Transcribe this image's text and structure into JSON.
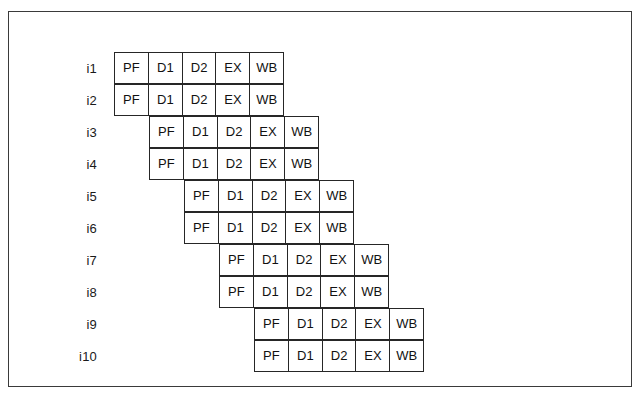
{
  "figure": {
    "type": "pipeline-timing-diagram",
    "stage_names": [
      "PF",
      "D1",
      "D2",
      "EX",
      "WB"
    ],
    "cell_width_px": 35,
    "cell_height_px": 32,
    "grid_origin_x_px": 113,
    "grid_origin_y_px": 52,
    "label_right_edge_px": 96,
    "colors": {
      "frame_border": "#3a3a3a",
      "cell_border": "#262626",
      "text": "#111111",
      "background": "#ffffff"
    },
    "rows": [
      {
        "label": "i1",
        "offset": 0,
        "stages": [
          "PF",
          "D1",
          "D2",
          "EX",
          "WB"
        ]
      },
      {
        "label": "i2",
        "offset": 0,
        "stages": [
          "PF",
          "D1",
          "D2",
          "EX",
          "WB"
        ]
      },
      {
        "label": "i3",
        "offset": 1,
        "stages": [
          "PF",
          "D1",
          "D2",
          "EX",
          "WB"
        ]
      },
      {
        "label": "i4",
        "offset": 1,
        "stages": [
          "PF",
          "D1",
          "D2",
          "EX",
          "WB"
        ]
      },
      {
        "label": "i5",
        "offset": 2,
        "stages": [
          "PF",
          "D1",
          "D2",
          "EX",
          "WB"
        ]
      },
      {
        "label": "i6",
        "offset": 2,
        "stages": [
          "PF",
          "D1",
          "D2",
          "EX",
          "WB"
        ]
      },
      {
        "label": "i7",
        "offset": 3,
        "stages": [
          "PF",
          "D1",
          "D2",
          "EX",
          "WB"
        ]
      },
      {
        "label": "i8",
        "offset": 3,
        "stages": [
          "PF",
          "D1",
          "D2",
          "EX",
          "WB"
        ]
      },
      {
        "label": "i9",
        "offset": 4,
        "stages": [
          "PF",
          "D1",
          "D2",
          "EX",
          "WB"
        ]
      },
      {
        "label": "i10",
        "offset": 4,
        "stages": [
          "PF",
          "D1",
          "D2",
          "EX",
          "WB"
        ]
      }
    ]
  }
}
